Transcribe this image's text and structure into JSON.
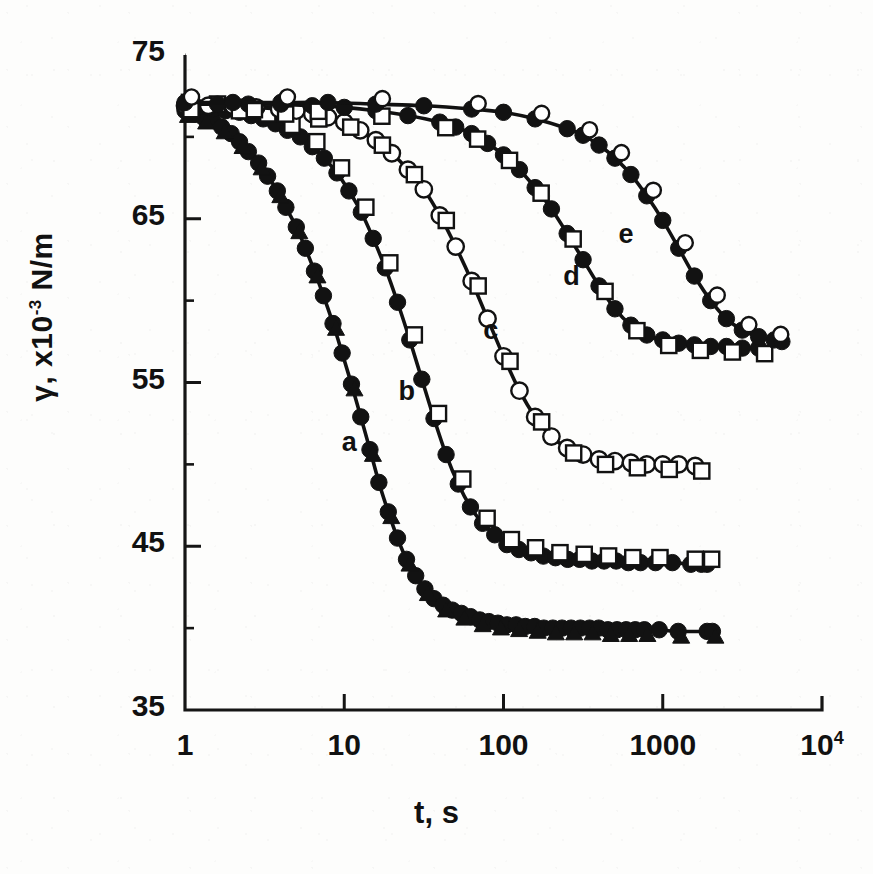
{
  "chart_data": {
    "type": "scatter",
    "title": "",
    "xlabel": "t, s",
    "ylabel": "γ, x10-3  N/m",
    "ylabel_parts": {
      "symbol": "γ",
      "comma": ", x10",
      "exp": "-3",
      "unit": " N/m"
    },
    "xscale": "log",
    "yscale": "linear",
    "xlim": [
      1,
      10000
    ],
    "ylim": [
      35,
      75
    ],
    "grid": false,
    "legend": "none",
    "xticks": [
      {
        "value": 1,
        "label": "1"
      },
      {
        "value": 10,
        "label": "10"
      },
      {
        "value": 100,
        "label": "100"
      },
      {
        "value": 1000,
        "label": "1000"
      },
      {
        "value": 10000,
        "label": "10",
        "sup": "4"
      }
    ],
    "yticks": [
      {
        "value": 75,
        "label": "75"
      },
      {
        "value": 65,
        "label": "65"
      },
      {
        "value": 55,
        "label": "55"
      },
      {
        "value": 45,
        "label": "45"
      },
      {
        "value": 35,
        "label": "35"
      }
    ],
    "annotations": [
      {
        "text": "a",
        "x": 11,
        "y": 51.2
      },
      {
        "text": "b",
        "x": 25,
        "y": 54.3
      },
      {
        "text": "c",
        "x": 85,
        "y": 58.0
      },
      {
        "text": "d",
        "x": 270,
        "y": 61.3
      },
      {
        "text": "e",
        "x": 600,
        "y": 63.9
      }
    ],
    "series": [
      {
        "name": "a",
        "marker": "filled-circle",
        "marker2": "filled-triangle",
        "color": "#111111",
        "plateau": 40.0,
        "points": [
          [
            1.0,
            71.6
          ],
          [
            1.15,
            71.4
          ],
          [
            1.3,
            71.2
          ],
          [
            1.5,
            71.0
          ],
          [
            1.7,
            70.6
          ],
          [
            1.95,
            70.2
          ],
          [
            2.2,
            69.7
          ],
          [
            2.5,
            69.1
          ],
          [
            2.9,
            68.4
          ],
          [
            3.3,
            67.6
          ],
          [
            3.8,
            66.7
          ],
          [
            4.3,
            65.7
          ],
          [
            5.0,
            64.5
          ],
          [
            5.7,
            63.2
          ],
          [
            6.5,
            61.8
          ],
          [
            7.4,
            60.3
          ],
          [
            8.5,
            58.6
          ],
          [
            9.7,
            56.8
          ],
          [
            11.1,
            54.9
          ],
          [
            12.7,
            52.9
          ],
          [
            14.5,
            50.9
          ],
          [
            16.5,
            48.9
          ],
          [
            18.9,
            47.1
          ],
          [
            21.6,
            45.5
          ],
          [
            24.6,
            44.2
          ],
          [
            28.1,
            43.2
          ],
          [
            32.1,
            42.4
          ],
          [
            36.6,
            41.8
          ],
          [
            41.8,
            41.4
          ],
          [
            47.7,
            41.1
          ],
          [
            54.4,
            40.9
          ],
          [
            62.1,
            40.7
          ],
          [
            70.9,
            40.5
          ],
          [
            80.9,
            40.4
          ],
          [
            92.3,
            40.3
          ],
          [
            105,
            40.2
          ],
          [
            120,
            40.2
          ],
          [
            137,
            40.1
          ],
          [
            157,
            40.1
          ],
          [
            179,
            40.0
          ],
          [
            204,
            40.0
          ],
          [
            233,
            40.0
          ],
          [
            266,
            40.0
          ],
          [
            304,
            40.0
          ],
          [
            347,
            40.0
          ],
          [
            396,
            40.0
          ],
          [
            452,
            39.9
          ],
          [
            516,
            39.9
          ],
          [
            589,
            39.9
          ],
          [
            672,
            39.9
          ],
          [
            767,
            39.9
          ],
          [
            950,
            39.9
          ],
          [
            1250,
            39.8
          ],
          [
            1900,
            39.8
          ],
          [
            2050,
            39.8
          ]
        ]
      },
      {
        "name": "b",
        "marker": "filled-circle",
        "marker2": "open-square",
        "color": "#111111",
        "plateau": 44.2,
        "points": [
          [
            1.0,
            71.8
          ],
          [
            1.2,
            71.8
          ],
          [
            1.5,
            71.7
          ],
          [
            1.8,
            71.6
          ],
          [
            2.2,
            71.5
          ],
          [
            2.6,
            71.3
          ],
          [
            3.1,
            71.1
          ],
          [
            3.7,
            70.8
          ],
          [
            4.4,
            70.4
          ],
          [
            5.3,
            70.0
          ],
          [
            6.3,
            69.4
          ],
          [
            7.5,
            68.7
          ],
          [
            9.0,
            67.8
          ],
          [
            10.7,
            66.7
          ],
          [
            12.8,
            65.4
          ],
          [
            15.2,
            63.8
          ],
          [
            18.1,
            62.0
          ],
          [
            21.6,
            59.9
          ],
          [
            25.8,
            57.6
          ],
          [
            30.7,
            55.2
          ],
          [
            36.6,
            52.8
          ],
          [
            43.6,
            50.6
          ],
          [
            52.0,
            48.8
          ],
          [
            62.0,
            47.4
          ],
          [
            73.9,
            46.4
          ],
          [
            88.1,
            45.7
          ],
          [
            105,
            45.1
          ],
          [
            125,
            44.8
          ],
          [
            149,
            44.6
          ],
          [
            178,
            44.4
          ],
          [
            212,
            44.3
          ],
          [
            253,
            44.2
          ],
          [
            301,
            44.2
          ],
          [
            359,
            44.1
          ],
          [
            428,
            44.1
          ],
          [
            510,
            44.1
          ],
          [
            608,
            44.0
          ],
          [
            725,
            44.0
          ],
          [
            900,
            44.0
          ],
          [
            1150,
            44.0
          ],
          [
            1500,
            43.9
          ],
          [
            1750,
            43.9
          ],
          [
            1900,
            43.9
          ]
        ]
      },
      {
        "name": "c",
        "marker": "open-circle",
        "marker2": "open-square",
        "color": "#111111",
        "plateau": 50.2,
        "points": [
          [
            1.0,
            71.9
          ],
          [
            1.4,
            71.9
          ],
          [
            2.0,
            71.9
          ],
          [
            2.8,
            71.8
          ],
          [
            3.9,
            71.7
          ],
          [
            5.0,
            71.6
          ],
          [
            6.3,
            71.4
          ],
          [
            7.9,
            71.2
          ],
          [
            10.0,
            70.9
          ],
          [
            12.6,
            70.4
          ],
          [
            15.8,
            69.8
          ],
          [
            19.9,
            69.0
          ],
          [
            25.1,
            68.0
          ],
          [
            31.6,
            66.8
          ],
          [
            39.8,
            65.2
          ],
          [
            50.1,
            63.3
          ],
          [
            63.1,
            61.2
          ],
          [
            79.4,
            58.9
          ],
          [
            100,
            56.6
          ],
          [
            126,
            54.5
          ],
          [
            158,
            52.9
          ],
          [
            200,
            51.7
          ],
          [
            251,
            51.0
          ],
          [
            316,
            50.6
          ],
          [
            398,
            50.3
          ],
          [
            501,
            50.2
          ],
          [
            631,
            50.1
          ],
          [
            794,
            50.0
          ],
          [
            1000,
            50.0
          ],
          [
            1260,
            50.0
          ],
          [
            1600,
            49.9
          ]
        ]
      },
      {
        "name": "d",
        "marker": "filled-circle",
        "marker2": "open-square",
        "color": "#111111",
        "plateau": 57.3,
        "points": [
          [
            1.0,
            72.0
          ],
          [
            1.6,
            72.0
          ],
          [
            2.5,
            72.0
          ],
          [
            4.0,
            72.0
          ],
          [
            6.3,
            71.9
          ],
          [
            10.0,
            71.8
          ],
          [
            15.8,
            71.6
          ],
          [
            25.1,
            71.3
          ],
          [
            39.8,
            70.9
          ],
          [
            50.1,
            70.6
          ],
          [
            63.1,
            70.2
          ],
          [
            79.4,
            69.6
          ],
          [
            100,
            68.9
          ],
          [
            126,
            68.0
          ],
          [
            158,
            66.9
          ],
          [
            200,
            65.6
          ],
          [
            251,
            64.1
          ],
          [
            316,
            62.5
          ],
          [
            398,
            60.9
          ],
          [
            501,
            59.5
          ],
          [
            631,
            58.5
          ],
          [
            794,
            57.9
          ],
          [
            1000,
            57.6
          ],
          [
            1260,
            57.4
          ],
          [
            1580,
            57.3
          ],
          [
            2000,
            57.2
          ],
          [
            2510,
            57.2
          ],
          [
            3160,
            57.1
          ],
          [
            4000,
            57.1
          ]
        ]
      },
      {
        "name": "e",
        "marker": "filled-circle",
        "marker2": "open-circle",
        "color": "#111111",
        "plateau": 57.6,
        "points": [
          [
            1.0,
            72.1
          ],
          [
            2.0,
            72.1
          ],
          [
            4.0,
            72.1
          ],
          [
            7.9,
            72.1
          ],
          [
            15.8,
            72.0
          ],
          [
            31.6,
            71.9
          ],
          [
            63.1,
            71.7
          ],
          [
            100,
            71.5
          ],
          [
            158,
            71.1
          ],
          [
            251,
            70.5
          ],
          [
            316,
            70.1
          ],
          [
            398,
            69.5
          ],
          [
            501,
            68.7
          ],
          [
            631,
            67.7
          ],
          [
            794,
            66.4
          ],
          [
            1000,
            64.9
          ],
          [
            1260,
            63.2
          ],
          [
            1580,
            61.5
          ],
          [
            2000,
            60.0
          ],
          [
            2510,
            58.9
          ],
          [
            3160,
            58.2
          ],
          [
            4000,
            57.8
          ],
          [
            5010,
            57.6
          ],
          [
            5600,
            57.5
          ]
        ]
      }
    ]
  }
}
